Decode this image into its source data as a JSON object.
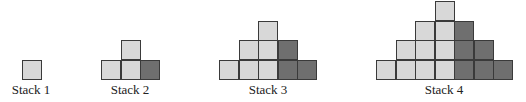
{
  "figure": {
    "colors": {
      "light": "#d8d8d8",
      "dark": "#6f6f6f",
      "border": "#3a3a3a"
    },
    "cell_size": 19.5,
    "baseline_y": 79,
    "stacks": [
      {
        "label": "Stack 1",
        "left": 22,
        "label_center": 31,
        "rows": [
          {
            "light": 1,
            "dark": 0
          }
        ]
      },
      {
        "label": "Stack 2",
        "left": 101,
        "label_center": 130,
        "rows": [
          {
            "light": 2,
            "dark": 1
          },
          {
            "light": 1,
            "dark": 0
          }
        ]
      },
      {
        "label": "Stack 3",
        "left": 219,
        "label_center": 268,
        "rows": [
          {
            "light": 3,
            "dark": 2
          },
          {
            "light": 2,
            "dark": 1
          },
          {
            "light": 1,
            "dark": 0
          }
        ]
      },
      {
        "label": "Stack 4",
        "left": 376,
        "label_center": 444,
        "rows": [
          {
            "light": 4,
            "dark": 3
          },
          {
            "light": 3,
            "dark": 2
          },
          {
            "light": 2,
            "dark": 1
          },
          {
            "light": 1,
            "dark": 0
          }
        ]
      }
    ]
  }
}
